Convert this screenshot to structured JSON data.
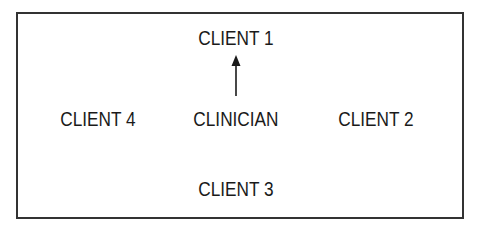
{
  "diagram": {
    "type": "communication-pattern",
    "nodes": {
      "center": "CLINICIAN",
      "top": "CLIENT 1",
      "right": "CLIENT 2",
      "bottom": "CLIENT 3",
      "left": "CLIENT 4"
    },
    "edges": [
      {
        "from": "CLINICIAN",
        "to": "CLIENT 1",
        "style": "single-arrow"
      }
    ],
    "colors": {
      "line": "#333333",
      "text": "#1a1a1a",
      "background": "#ffffff"
    }
  }
}
